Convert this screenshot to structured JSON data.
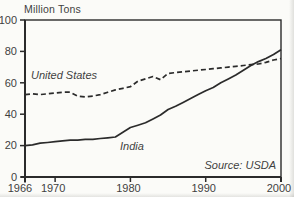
{
  "chart": {
    "unit_label": "Million Tons",
    "us_label": "United States",
    "india_label": "India",
    "source_label": "Source: USDA",
    "ink_color": "#2b2b2b",
    "text_color": "#3f3f3f",
    "background_color": "#fbfbf8"
  },
  "chart_data": {
    "type": "line",
    "title": "",
    "ylabel": "Million Tons",
    "xlabel": "",
    "source": "Source: USDA",
    "legend": "inline labels",
    "grid": false,
    "xlim": [
      1966,
      2000
    ],
    "ylim": [
      0,
      100
    ],
    "x_ticks": [
      1966,
      1970,
      1980,
      1990,
      2000
    ],
    "y_ticks": [
      0,
      20,
      40,
      60,
      80,
      100
    ],
    "x": [
      1966,
      1967,
      1968,
      1969,
      1970,
      1971,
      1972,
      1973,
      1974,
      1975,
      1976,
      1977,
      1978,
      1979,
      1980,
      1981,
      1982,
      1983,
      1984,
      1985,
      1986,
      1987,
      1988,
      1989,
      1990,
      1991,
      1992,
      1993,
      1994,
      1995,
      1996,
      1997,
      1998,
      1999,
      2000
    ],
    "series": [
      {
        "name": "United States",
        "style": "dashed",
        "values": [
          52.5,
          53,
          52.5,
          53,
          53.5,
          54,
          54,
          51.5,
          51,
          51.5,
          52.5,
          54,
          55.5,
          56.5,
          57.5,
          61,
          62.5,
          64,
          62,
          66,
          66.5,
          67,
          67.5,
          68,
          68.5,
          69,
          69.5,
          70,
          70.5,
          71,
          71.5,
          72,
          73,
          74.5,
          75.5
        ]
      },
      {
        "name": "India",
        "style": "solid",
        "values": [
          20,
          20.5,
          21.5,
          22,
          22.5,
          23,
          23.5,
          23.5,
          24,
          24,
          24.5,
          25,
          25.5,
          28.5,
          31.5,
          33,
          34.5,
          37,
          39.5,
          43,
          45,
          47.5,
          50,
          52.5,
          55,
          57,
          60,
          62.5,
          65,
          68,
          71,
          73.5,
          75.5,
          78,
          81
        ]
      }
    ]
  }
}
